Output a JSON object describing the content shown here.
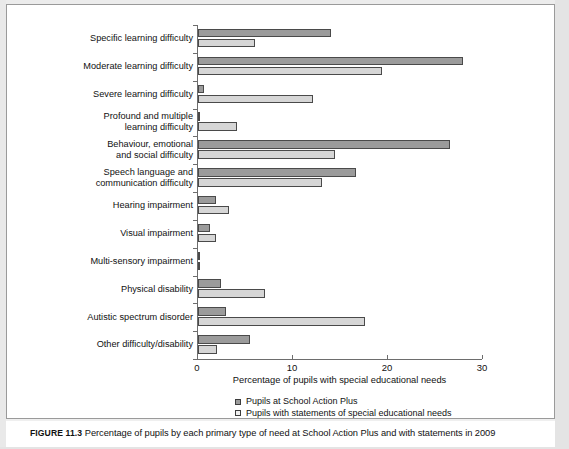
{
  "figure": {
    "label": "FIGURE 11.3",
    "caption": "Percentage of pupils by each primary type of need at School Action Plus and with statements in 2009"
  },
  "chart_data": {
    "type": "bar",
    "orientation": "horizontal",
    "title": "",
    "xlabel": "Percentage of pupils with special educational needs",
    "ylabel": "",
    "xlim": [
      0,
      30
    ],
    "xticks": [
      0,
      10,
      20,
      30
    ],
    "xtick_labels": [
      "0",
      "10",
      "20",
      "30"
    ],
    "grid": false,
    "legend_position": "below-axes",
    "categories": [
      "Specific learning difficulty",
      "Moderate learning difficulty",
      "Severe learning difficulty",
      "Profound and multiple learning difficulty",
      "Behaviour, emotional and social difficulty",
      "Speech language and communication difficulty",
      "Hearing impairment",
      "Visual impairment",
      "Multi-sensory impairment",
      "Physical disability",
      "Autistic spectrum disorder",
      "Other difficulty/disability"
    ],
    "category_label_lines": [
      [
        "Specific learning difficulty"
      ],
      [
        "Moderate learning difficulty"
      ],
      [
        "Severe learning difficulty"
      ],
      [
        "Profound and multiple",
        "learning difficulty"
      ],
      [
        "Behaviour, emotional",
        "and social difficulty"
      ],
      [
        "Speech language and",
        "communication difficulty"
      ],
      [
        "Hearing impairment"
      ],
      [
        "Visual impairment"
      ],
      [
        "Multi-sensory impairment"
      ],
      [
        "Physical disability"
      ],
      [
        "Autistic spectrum disorder"
      ],
      [
        "Other difficulty/disability"
      ]
    ],
    "series": [
      {
        "name": "Pupils at School Action Plus",
        "color": "#9b9b9b",
        "values": [
          14.0,
          27.9,
          0.6,
          0.2,
          26.5,
          16.6,
          1.9,
          1.3,
          0.1,
          2.4,
          2.9,
          5.5
        ]
      },
      {
        "name": "Pupils with statements of special educational needs",
        "color": "#d6d6d6",
        "values": [
          6.0,
          19.4,
          12.1,
          4.1,
          14.4,
          13.1,
          3.3,
          1.9,
          0.2,
          7.0,
          17.6,
          2.0
        ]
      }
    ]
  },
  "legend": {
    "items": [
      "Pupils at School Action Plus",
      "Pupils with statements of special educational needs"
    ]
  }
}
